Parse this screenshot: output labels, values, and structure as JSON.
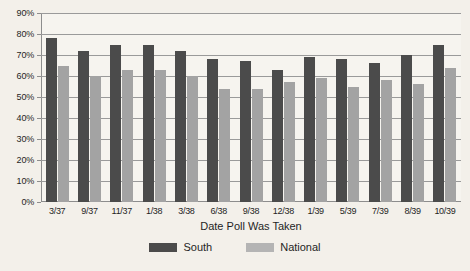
{
  "chart_data": {
    "type": "bar",
    "title": "",
    "xlabel": "Date Poll Was Taken",
    "ylabel": "",
    "ylim": [
      0,
      90
    ],
    "ytick_step": 10,
    "ytick_labels": [
      "90%",
      "80%",
      "70%",
      "60%",
      "50%",
      "40%",
      "30%",
      "20%",
      "10%",
      "0%"
    ],
    "grid": true,
    "legend_position": "bottom",
    "categories": [
      "3/37",
      "9/37",
      "11/37",
      "1/38",
      "3/38",
      "6/38",
      "9/38",
      "12/38",
      "1/39",
      "5/39",
      "7/39",
      "8/39",
      "10/39"
    ],
    "series": [
      {
        "name": "South",
        "color": "#4b4b4b",
        "values": [
          78,
          72,
          75,
          75,
          72,
          68,
          67,
          63,
          69,
          68,
          66,
          70,
          75
        ]
      },
      {
        "name": "National",
        "color": "#a3a3a3",
        "values": [
          65,
          60,
          63,
          63,
          60,
          54,
          54,
          57,
          59,
          55,
          58,
          56,
          64
        ]
      }
    ]
  },
  "legend": {
    "items": [
      {
        "label": "South",
        "swatch": "south-swatch"
      },
      {
        "label": "National",
        "swatch": "national-swatch"
      }
    ]
  }
}
